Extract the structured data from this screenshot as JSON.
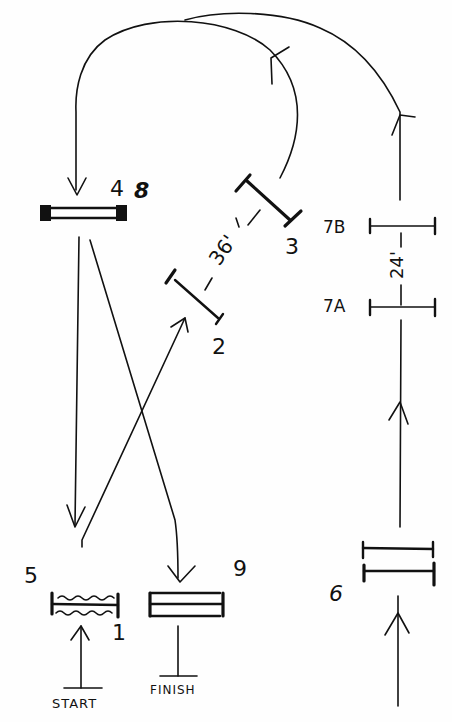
{
  "diagram": {
    "type": "optical-beam-path",
    "style": "hand-drawn",
    "colors": {
      "ink": "#111111",
      "background": "#fefefe"
    },
    "labels": {
      "mirror_1": "1",
      "mirror_2": "2",
      "mirror_3": "3",
      "mirror_4": "4",
      "mirror_5": "5",
      "mirror_6": "6",
      "mirror_7a": "7A",
      "mirror_7b": "7B",
      "mirror_8": "8",
      "mirror_9": "9",
      "start": "START",
      "finish": "FINISH",
      "distance_36": "36'",
      "distance_24": "24'"
    },
    "elements": [
      {
        "id": "1",
        "kind": "mirror (wavy, paired with 5)",
        "position": "bottom-left"
      },
      {
        "id": "2",
        "kind": "mirror (angled)",
        "position": "center"
      },
      {
        "id": "3",
        "kind": "mirror (angled, thick)",
        "position": "upper-center"
      },
      {
        "id": "4/8",
        "kind": "double mirror",
        "position": "upper-left"
      },
      {
        "id": "5",
        "kind": "mirror (wavy)",
        "position": "bottom-left"
      },
      {
        "id": "6",
        "kind": "double mirror",
        "position": "bottom-right"
      },
      {
        "id": "7A",
        "kind": "mirror",
        "position": "right"
      },
      {
        "id": "7B",
        "kind": "mirror",
        "position": "right-upper"
      },
      {
        "id": "9",
        "kind": "double mirror",
        "position": "bottom-center"
      }
    ],
    "distances": [
      {
        "between": [
          "2",
          "3"
        ],
        "value": "36'"
      },
      {
        "between": [
          "7A",
          "7B"
        ],
        "value": "24'"
      }
    ]
  }
}
